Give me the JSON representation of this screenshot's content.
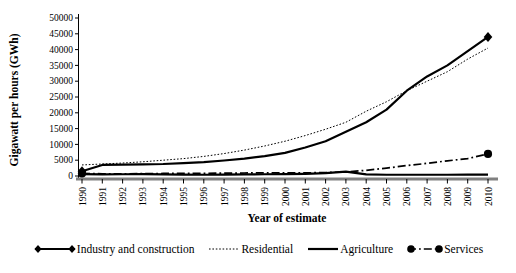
{
  "chart_data": {
    "type": "line",
    "title": "",
    "xlabel": "Year of estimate",
    "ylabel": "Gigawatt per hours (GWh)",
    "x": [
      1990,
      1991,
      1992,
      1993,
      1994,
      1995,
      1996,
      1997,
      1998,
      1999,
      2000,
      2001,
      2002,
      2003,
      2004,
      2005,
      2006,
      2007,
      2008,
      2009,
      2010
    ],
    "ylim": [
      0,
      50000
    ],
    "yticks": [
      0,
      5000,
      10000,
      15000,
      20000,
      25000,
      30000,
      35000,
      40000,
      45000,
      50000
    ],
    "grid": false,
    "legend_position": "bottom",
    "line_color": "#000000",
    "axis_color": "#808080",
    "series": [
      {
        "name": "Industry and construction",
        "style": "solid",
        "stroke_width": 2.2,
        "marker": "diamond",
        "marker_at": "ends",
        "values": [
          1500,
          3500,
          3600,
          3700,
          3800,
          4100,
          4400,
          4900,
          5500,
          6300,
          7300,
          9000,
          11000,
          14000,
          17000,
          21000,
          27000,
          31500,
          35000,
          39500,
          44000
        ]
      },
      {
        "name": "Residential",
        "style": "dotted",
        "stroke_width": 1,
        "marker": "none",
        "marker_at": "none",
        "values": [
          3500,
          3800,
          4100,
          4500,
          5000,
          5500,
          6200,
          7100,
          8200,
          9500,
          11000,
          12800,
          14800,
          17000,
          20500,
          23500,
          27000,
          30000,
          33000,
          37000,
          40500
        ]
      },
      {
        "name": "Agriculture",
        "style": "solid",
        "stroke_width": 2.2,
        "marker": "none",
        "marker_at": "none",
        "values": [
          600,
          500,
          550,
          600,
          500,
          450,
          400,
          450,
          500,
          550,
          600,
          700,
          900,
          1400,
          500,
          400,
          400,
          400,
          400,
          450,
          450
        ]
      },
      {
        "name": "Services",
        "style": "dashdot",
        "stroke_width": 1.7,
        "marker": "circle",
        "marker_at": "ends",
        "values": [
          800,
          700,
          700,
          750,
          800,
          800,
          850,
          900,
          950,
          1000,
          1000,
          1000,
          1100,
          1300,
          1800,
          2500,
          3300,
          4000,
          4800,
          5500,
          7000
        ]
      }
    ]
  }
}
